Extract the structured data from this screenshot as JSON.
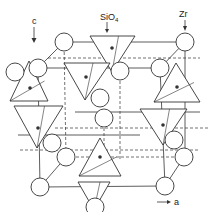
{
  "figure": {
    "type": "crystal-structure-diagram",
    "labels": {
      "c_axis": "c",
      "a_axis": "a",
      "sio4": "SiO",
      "sio4_sub": "4",
      "zr": "Zr"
    },
    "colors": {
      "line": "#333333",
      "background": "#ffffff",
      "atom_fill": "#ffffff"
    },
    "zr_atoms": [
      {
        "cx": 64,
        "cy": 42,
        "r": 9
      },
      {
        "cx": 185,
        "cy": 42,
        "r": 9
      },
      {
        "cx": 38,
        "cy": 68,
        "r": 9
      },
      {
        "cx": 160,
        "cy": 68,
        "r": 9
      },
      {
        "cx": 120,
        "cy": 71,
        "r": 9
      },
      {
        "cx": 15,
        "cy": 72,
        "r": 9
      },
      {
        "cx": 100,
        "cy": 98,
        "r": 9
      },
      {
        "cx": 174,
        "cy": 140,
        "r": 9
      },
      {
        "cx": 184,
        "cy": 157,
        "r": 9
      },
      {
        "cx": 52,
        "cy": 143,
        "r": 9
      },
      {
        "cx": 66,
        "cy": 157,
        "r": 9
      },
      {
        "cx": 40,
        "cy": 187,
        "r": 9
      },
      {
        "cx": 165,
        "cy": 186,
        "r": 9
      },
      {
        "cx": 104,
        "cy": 118,
        "r": 9
      },
      {
        "cx": 95,
        "cy": 207,
        "r": 9
      }
    ],
    "sio4_tetrahedra": [
      {
        "points": "90,36 135,36 112,72",
        "dot": [
          112,
          48
        ]
      },
      {
        "points": "29,61 48,101 10,101",
        "dot": [
          30,
          88
        ]
      },
      {
        "points": "64,63 110,63 85,100",
        "dot": [
          86,
          77
        ]
      },
      {
        "points": "176,63 200,102 154,102",
        "dot": [
          177,
          87
        ]
      },
      {
        "points": "14,106 63,106 37,148",
        "dot": [
          38,
          128
        ]
      },
      {
        "points": "140,109 187,109 163,145",
        "dot": [
          163,
          125
        ]
      },
      {
        "points": "100,138 121,176 79,176",
        "dot": [
          100,
          157
        ]
      },
      {
        "points": "78,182 110,182 94,210",
        "dot": null
      }
    ]
  }
}
